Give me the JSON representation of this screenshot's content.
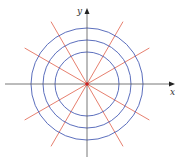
{
  "diagram": {
    "type": "polar-grid",
    "center": [
      87,
      84
    ],
    "circle_radii": [
      32,
      44,
      56
    ],
    "ray_angles_deg": [
      30,
      60,
      120,
      150,
      210,
      240,
      300,
      330
    ],
    "ray_length": 72,
    "axis_labels": {
      "x": "x",
      "y": "y"
    },
    "colors": {
      "circles": "#4a5fb5",
      "rays": "#e0604a",
      "axes": "#555555",
      "center": "#cc2222"
    }
  }
}
